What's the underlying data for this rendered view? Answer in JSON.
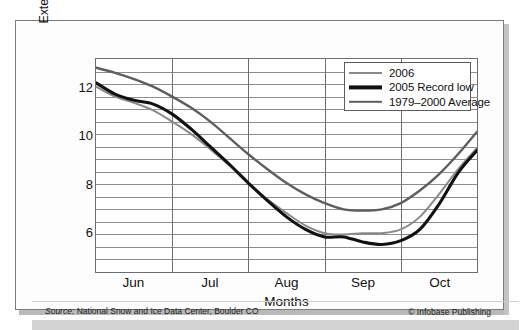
{
  "chart_data": {
    "type": "line",
    "title": "",
    "xlabel": "Months",
    "ylabel": "Extent (millions of square kilometers)",
    "ylim": [
      4.5,
      13.0
    ],
    "yticks": [
      6,
      8,
      10,
      12
    ],
    "ytick_labels": [
      "6",
      "8",
      "10",
      "12"
    ],
    "grid": "horizontal-and-month-verticals",
    "gridline_step": 0.5,
    "legend_position": "top-right-inside",
    "x_axis": {
      "categories": [
        "Jun",
        "Jul",
        "Aug",
        "Sep",
        "Oct"
      ],
      "range_start": "Jun 1",
      "range_end": "Oct 31",
      "unit": "month"
    },
    "series": [
      {
        "name": "2006",
        "color": "#8a8a8a",
        "width": 2.0,
        "x": [
          0.0,
          0.25,
          0.5,
          0.75,
          1.0,
          1.25,
          1.5,
          1.75,
          2.0,
          2.25,
          2.5,
          2.75,
          3.0,
          3.25,
          3.5,
          3.75,
          4.0,
          4.25,
          4.5,
          4.75,
          5.0
        ],
        "values": [
          11.9,
          11.5,
          11.25,
          10.95,
          10.5,
          10.0,
          9.4,
          8.75,
          8.05,
          7.4,
          6.85,
          6.35,
          6.05,
          6.0,
          6.05,
          6.05,
          6.2,
          6.7,
          7.6,
          8.6,
          9.45
        ]
      },
      {
        "name": "2005 Record low",
        "color": "#111111",
        "width": 3.1,
        "x": [
          0.0,
          0.25,
          0.5,
          0.75,
          1.0,
          1.25,
          1.5,
          1.75,
          2.0,
          2.25,
          2.5,
          2.75,
          3.0,
          3.25,
          3.5,
          3.75,
          4.0,
          4.25,
          4.5,
          4.75,
          5.0
        ],
        "values": [
          12.05,
          11.6,
          11.35,
          11.2,
          10.8,
          10.2,
          9.5,
          8.8,
          8.05,
          7.35,
          6.7,
          6.2,
          5.9,
          5.9,
          5.7,
          5.6,
          5.75,
          6.2,
          7.2,
          8.45,
          9.35
        ]
      },
      {
        "name": "1979–2000 Average",
        "color": "#5e5e5e",
        "width": 2.4,
        "x": [
          0.0,
          0.25,
          0.5,
          0.75,
          1.0,
          1.25,
          1.5,
          1.75,
          2.0,
          2.25,
          2.5,
          2.75,
          3.0,
          3.25,
          3.5,
          3.75,
          4.0,
          4.25,
          4.5,
          4.75,
          5.0
        ],
        "values": [
          12.65,
          12.45,
          12.2,
          11.9,
          11.5,
          11.05,
          10.5,
          9.85,
          9.2,
          8.6,
          8.05,
          7.6,
          7.25,
          7.0,
          6.95,
          7.0,
          7.25,
          7.75,
          8.4,
          9.2,
          10.1
        ]
      }
    ],
    "annotations": []
  },
  "legend": {
    "items": [
      {
        "label": "2006",
        "color": "#8a8a8a",
        "thickness": "thin"
      },
      {
        "label": "2005 Record low",
        "color": "#111111",
        "thickness": "thick"
      },
      {
        "label": "1979–2000 Average",
        "color": "#5e5e5e",
        "thickness": "medium"
      }
    ]
  },
  "axes": {
    "y_title": "Extent (millions of square kilometers)",
    "x_title": "Months",
    "y_tick_labels": [
      "12",
      "10",
      "8",
      "6"
    ],
    "x_tick_labels": [
      "Jun",
      "Jul",
      "Aug",
      "Sep",
      "Oct"
    ]
  },
  "footer": {
    "source_prefix": "Source:",
    "source_text": "National Snow and Ice Data Center, Boulder CO",
    "credit": "© Infobase Publishing"
  }
}
